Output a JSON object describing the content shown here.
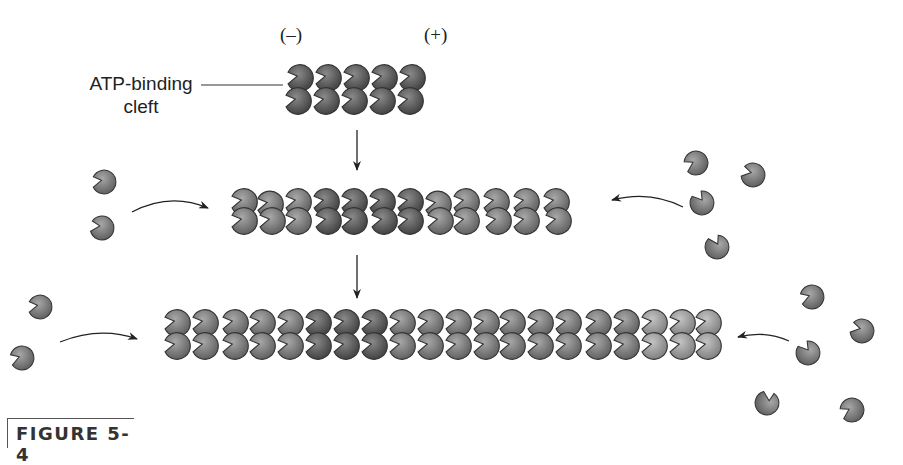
{
  "figure": {
    "label": "FIGURE 5-4",
    "ends": {
      "minus": "(–)",
      "plus": "(+)"
    },
    "callout": {
      "line1": "ATP-binding",
      "line2": "cleft"
    },
    "colors": {
      "dark_subunit": "#555555",
      "medium_subunit": "#7a7a7a",
      "light_subunit": "#9a9a9a",
      "outline": "#333333",
      "arrow": "#222222"
    },
    "stages": [
      {
        "name": "seed",
        "subunit_pairs": 5
      },
      {
        "name": "elongation-1",
        "subunit_pairs": 12
      },
      {
        "name": "elongation-2",
        "subunit_pairs": 19
      }
    ],
    "free_monomers": {
      "left_stage2": 2,
      "right_stage2": 4,
      "left_stage3": 2,
      "right_stage3": 5
    }
  }
}
